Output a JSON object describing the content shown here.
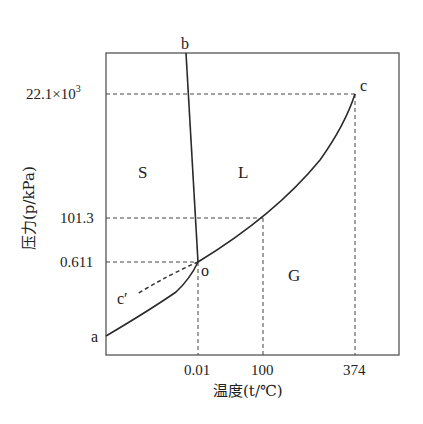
{
  "diagram": {
    "x_axis": {
      "label": "温度(t/℃)",
      "ticks": [
        "0.01",
        "100",
        "374"
      ]
    },
    "y_axis": {
      "label": "压力(p/kPa)",
      "ticks": [
        "22.1×10³",
        "101.3",
        "0.611"
      ],
      "ticks_parts": {
        "critical_base": "22.1×10",
        "critical_exp": "3"
      }
    },
    "regions": {
      "solid": "S",
      "liquid": "L",
      "gas": "G"
    },
    "points": {
      "a": "a",
      "b": "b",
      "c": "c",
      "c_prime": "c′",
      "o": "o"
    },
    "curves": [
      {
        "name": "oa",
        "description": "sublimation curve (solid-gas)"
      },
      {
        "name": "ob",
        "description": "melting curve (solid-liquid)"
      },
      {
        "name": "oc",
        "description": "vaporization curve (liquid-gas), ends at critical point c"
      },
      {
        "name": "oc′",
        "description": "supercooled water (metastable), dashed"
      }
    ],
    "colors": {
      "line": "#2a2a2a",
      "dash": "#444444",
      "frame": "#555555",
      "background": "#ffffff"
    }
  }
}
